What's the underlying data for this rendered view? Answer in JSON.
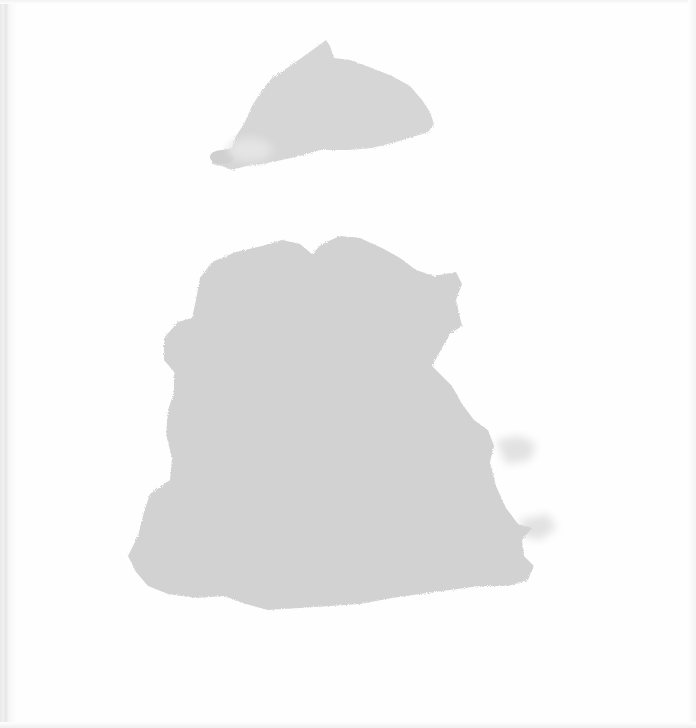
{
  "page": {
    "kind": "scanned cover with watercolor shapes",
    "background_color": "#fefefe"
  },
  "shapes": [
    {
      "name": "small-top-blob",
      "color": "#d6d6d6"
    },
    {
      "name": "large-bottom-blob",
      "color": "#d2d2d2"
    }
  ]
}
